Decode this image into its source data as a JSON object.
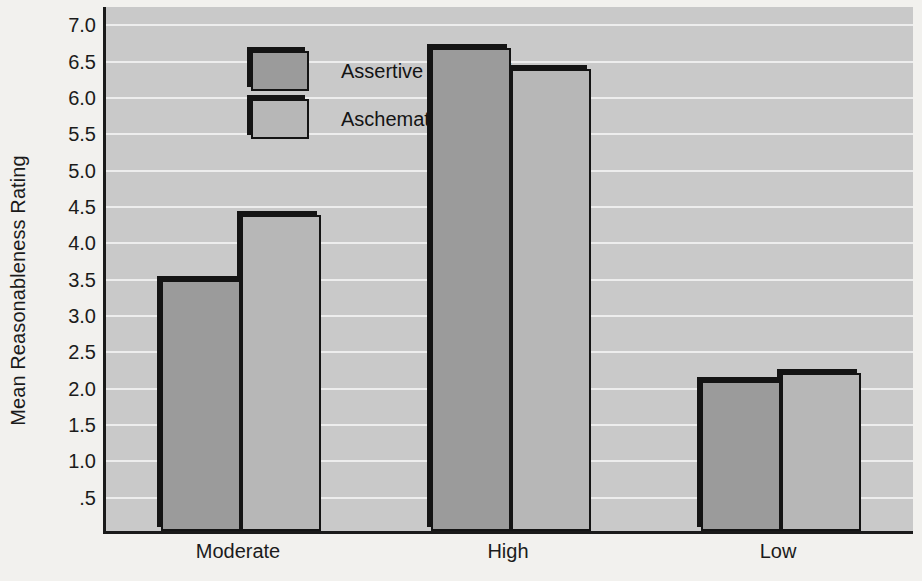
{
  "chart_data": {
    "type": "bar",
    "title": "",
    "xlabel": "",
    "ylabel": "Mean Reasonableness Rating",
    "categories": [
      "Moderate",
      "High",
      "Low"
    ],
    "series": [
      {
        "name": "Assertive Schematics",
        "color": "#9b9b9b",
        "values": [
          3.45,
          6.65,
          2.07
        ]
      },
      {
        "name": "Aschematics",
        "color": "#b7b7b7",
        "values": [
          4.35,
          6.35,
          2.17
        ]
      }
    ],
    "ylim": [
      0,
      7.25
    ],
    "ytick_values": [
      0.5,
      1.0,
      1.5,
      2.0,
      2.5,
      3.0,
      3.5,
      4.0,
      4.5,
      5.0,
      5.5,
      6.0,
      6.5,
      7.0
    ],
    "ytick_labels": [
      ".5",
      "1.0",
      "1.5",
      "2.0",
      "2.5",
      "3.0",
      "3.5",
      "4.0",
      "4.5",
      "5.0",
      "5.5",
      "6.0",
      "6.5",
      "7.0"
    ],
    "grid": true,
    "grid_color": "#f0f0f0",
    "plot_background": "#c9c9c9",
    "page_background": "#f2f1ee",
    "legend_position": "upper-left-inside",
    "bar_border_color": "#141414"
  },
  "legend": {
    "entries": [
      {
        "label": "Assertive Schematics"
      },
      {
        "label": "Aschematics"
      }
    ]
  },
  "axis": {
    "y_title": "Mean Reasonableness Rating"
  }
}
